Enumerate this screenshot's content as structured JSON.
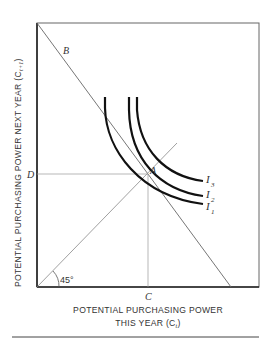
{
  "diagram": {
    "y_axis_label": "POTENTIAL PURCHASING POWER NEXT YEAR (C",
    "y_axis_subscript": "t+1",
    "y_axis_suffix": ")",
    "x_axis_label_line1": "POTENTIAL PURCHASING POWER",
    "x_axis_label_line2": "THIS YEAR (C",
    "x_axis_subscript": "t",
    "x_axis_suffix": ")",
    "point_labels": {
      "budget": "B",
      "optimum": "A",
      "y_level": "D",
      "x_level": "C"
    },
    "angle_label": "45°",
    "curves": [
      {
        "name": "I",
        "sub": "3"
      },
      {
        "name": "I",
        "sub": "2"
      },
      {
        "name": "I",
        "sub": "1"
      }
    ],
    "colors": {
      "frame": "#555555",
      "thin_line": "#777777",
      "curve": "#111111",
      "text": "#333333"
    }
  }
}
